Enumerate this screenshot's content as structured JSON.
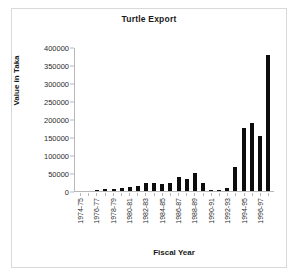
{
  "chart_data": {
    "type": "bar",
    "title": "Turtle Export",
    "xlabel": "Fiscal Year",
    "ylabel": "Value in Taka",
    "ylim": [
      0,
      400000
    ],
    "ytick_labels": [
      "400000",
      "350000",
      "300000",
      "250000",
      "200000",
      "150000",
      "100000",
      "50000",
      "0"
    ],
    "ytick_values": [
      400000,
      350000,
      300000,
      250000,
      200000,
      150000,
      100000,
      50000,
      0
    ],
    "grid": false,
    "legend": null,
    "categories": [
      "1974-75",
      "1975-76",
      "1976-77",
      "1977-78",
      "1978-79",
      "1979-80",
      "1980-81",
      "1981-82",
      "1982-83",
      "1983-84",
      "1984-85",
      "1985-86",
      "1986-87",
      "1987-88",
      "1988-89",
      "1989-90",
      "1990-91",
      "1991-92",
      "1992-93",
      "1993-94",
      "1994-95",
      "1995-96",
      "1996-97",
      "1997-98"
    ],
    "xtick_labels_shown": [
      "1974-75",
      "",
      "1976-77",
      "",
      "1978-79",
      "",
      "1980-81",
      "",
      "1982-83",
      "",
      "1984-85",
      "",
      "1986-87",
      "",
      "1988-89",
      "",
      "1990-91",
      "",
      "1992-93",
      "",
      "1994-95",
      "",
      "1996-97",
      ""
    ],
    "values": [
      0,
      0,
      2000,
      5000,
      5000,
      9000,
      11000,
      15000,
      21000,
      22000,
      20000,
      22000,
      38000,
      34000,
      49000,
      21000,
      4000,
      4000,
      7000,
      68000,
      176000,
      188000,
      154000,
      378000
    ],
    "bar_color": "#0d0d0d"
  }
}
